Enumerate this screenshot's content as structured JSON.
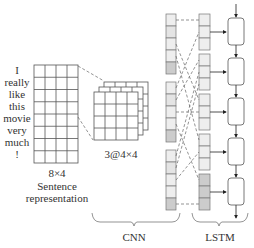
{
  "sentence": {
    "words": [
      "I",
      "really",
      "like",
      "this",
      "movie",
      "very",
      "much",
      "!"
    ],
    "dims_label": "8×4",
    "caption_line1": "Sentence",
    "caption_line2": "representation"
  },
  "feature_maps": {
    "label": "3@4×4"
  },
  "sections": {
    "cnn_label": "CNN",
    "lstm_label": "LSTM"
  },
  "colors": {
    "grid_line": "#555555",
    "cell_light": "#eeeeee",
    "cell_dark": "#cccccc",
    "dash": "#666666"
  }
}
